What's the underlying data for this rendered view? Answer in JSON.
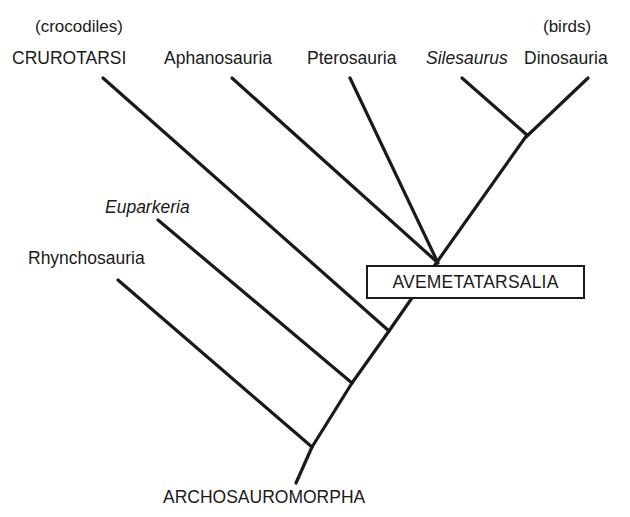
{
  "figure": {
    "type": "cladogram",
    "background_color": "#ffffff",
    "line_color": "#1a1a1a",
    "text_color": "#1a1a1a"
  },
  "taxa": [
    {
      "id": "crurotarsi",
      "label": "CRUROTARSI",
      "style": "caps",
      "annotation": "(crocodiles)",
      "label_x": 12,
      "label_y": 50,
      "annotation_x": 35,
      "annotation_y": 18
    },
    {
      "id": "aphanosauria",
      "label": "Aphanosauria",
      "style": "regular",
      "annotation": "",
      "label_x": 164,
      "label_y": 50
    },
    {
      "id": "pterosauria",
      "label": "Pterosauria",
      "style": "regular",
      "annotation": "",
      "label_x": 307,
      "label_y": 50
    },
    {
      "id": "silesaurus",
      "label": "Silesaurus",
      "style": "italic",
      "annotation": "",
      "label_x": 426,
      "label_y": 50
    },
    {
      "id": "dinosauria",
      "label": "Dinosauria",
      "style": "regular",
      "annotation": "(birds)",
      "label_x": 524,
      "label_y": 50,
      "annotation_x": 543,
      "annotation_y": 18
    },
    {
      "id": "euparkeria",
      "label": "Euparkeria",
      "style": "italic",
      "annotation": "",
      "label_x": 105,
      "label_y": 199
    },
    {
      "id": "rhynchosauria",
      "label": "Rhynchosauria",
      "style": "regular",
      "annotation": "",
      "label_x": 28,
      "label_y": 250
    }
  ],
  "clade_labels": [
    {
      "id": "avemetatarsalia",
      "label": "AVEMETATARSALIA",
      "boxed": true,
      "x": 366,
      "y": 265,
      "width": 219,
      "height": 34
    },
    {
      "id": "archosauromorpha",
      "label": "ARCHOSAUROMORPHA",
      "boxed": false,
      "x": 163,
      "y": 489
    }
  ],
  "branches": [
    {
      "id": "branch-crurotarsi",
      "x1": 103,
      "y1": 78,
      "x2": 389,
      "y2": 331
    },
    {
      "id": "branch-aphanosauria",
      "x1": 232,
      "y1": 78,
      "x2": 437,
      "y2": 262
    },
    {
      "id": "branch-pterosauria",
      "x1": 350,
      "y1": 78,
      "x2": 438,
      "y2": 263
    },
    {
      "id": "branch-silesaurus",
      "x1": 462,
      "y1": 78,
      "x2": 527,
      "y2": 135
    },
    {
      "id": "branch-dinosauria",
      "x1": 588,
      "y1": 78,
      "x2": 526,
      "y2": 137
    },
    {
      "id": "branch-euparkeria",
      "x1": 158,
      "y1": 220,
      "x2": 352,
      "y2": 383
    },
    {
      "id": "branch-rhynchosauria",
      "x1": 118,
      "y1": 280,
      "x2": 312,
      "y2": 447
    },
    {
      "id": "backbone-upper",
      "x1": 527,
      "y1": 135,
      "x2": 437,
      "y2": 262
    },
    {
      "id": "backbone-avemeta",
      "x1": 437,
      "y1": 262,
      "x2": 389,
      "y2": 331
    },
    {
      "id": "backbone-crurotarsi",
      "x1": 389,
      "y1": 331,
      "x2": 352,
      "y2": 383
    },
    {
      "id": "backbone-euparkeria",
      "x1": 352,
      "y1": 383,
      "x2": 312,
      "y2": 447
    },
    {
      "id": "backbone-root-stem",
      "x1": 312,
      "y1": 447,
      "x2": 296,
      "y2": 483
    }
  ],
  "line_width": 3.2
}
